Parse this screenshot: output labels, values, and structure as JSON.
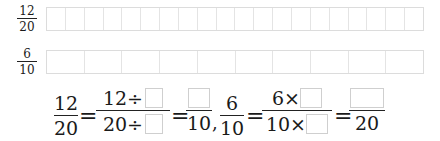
{
  "strips": [
    {
      "label": {
        "numerator": "12",
        "denominator": "20"
      },
      "cells": 20
    },
    {
      "label": {
        "numerator": "6",
        "denominator": "10"
      },
      "cells": 10
    }
  ],
  "equation1": {
    "lhs": {
      "numerator": "12",
      "denominator": "20"
    },
    "equals": "=",
    "middle": {
      "numerator_text": "12÷",
      "denominator_text": "20÷"
    },
    "rhs": {
      "denominator": "10"
    }
  },
  "separator": ",",
  "equation2": {
    "lhs": {
      "numerator": "6",
      "denominator": "10"
    },
    "equals": "=",
    "middle": {
      "numerator_text": "6×",
      "denominator_text": "10×"
    },
    "rhs": {
      "denominator": "20"
    }
  }
}
